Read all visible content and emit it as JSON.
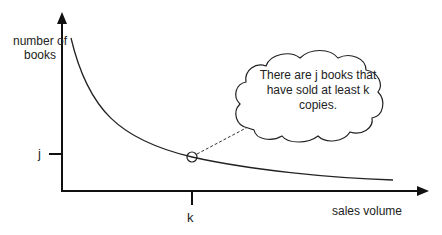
{
  "diagram": {
    "y_axis_label": "number of books",
    "x_axis_label": "sales volume",
    "y_tick_label": "j",
    "x_tick_label": "k",
    "callout_text": "There are j books that have sold at least k copies.",
    "curve": "decreasing long-tail curve",
    "marker": "open circle at (k, j)"
  }
}
